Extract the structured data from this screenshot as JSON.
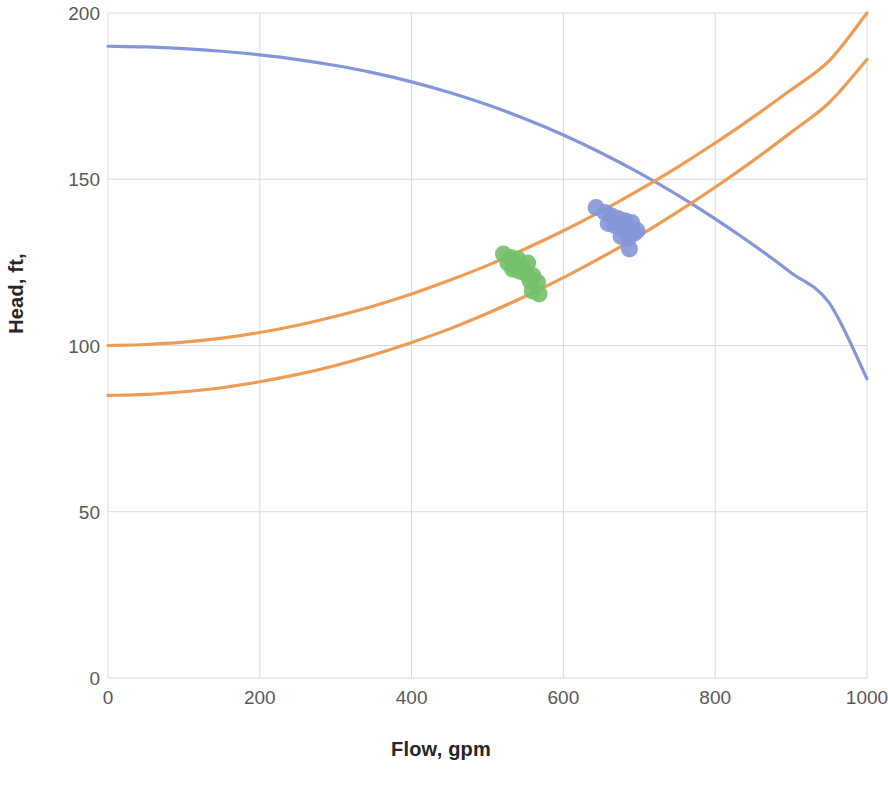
{
  "chart_data": {
    "type": "line",
    "title": "",
    "xlabel": "Flow, gpm",
    "ylabel": "Head, ft,",
    "xlim": [
      0,
      1000
    ],
    "ylim": [
      0,
      200
    ],
    "xticks": [
      0,
      200,
      400,
      600,
      800,
      1000
    ],
    "yticks": [
      0,
      50,
      100,
      150,
      200
    ],
    "xtick_labels": [
      "0",
      "200",
      "400",
      "600",
      "800",
      "1000"
    ],
    "ytick_labels": [
      "0",
      "50",
      "100",
      "150",
      "200"
    ],
    "grid": true,
    "grid_color": "#D9D9D9",
    "legend": "none",
    "series": [
      {
        "name": "Pump curve",
        "type": "line",
        "color": "#8496D9",
        "linewidth": 3.2,
        "x": [
          0,
          50,
          100,
          150,
          200,
          250,
          300,
          350,
          400,
          450,
          500,
          550,
          600,
          650,
          700,
          750,
          800,
          850,
          900,
          950,
          1000
        ],
        "y": [
          190.0,
          189.8,
          189.3,
          188.5,
          187.4,
          186.0,
          184.2,
          182.0,
          179.3,
          176.1,
          172.4,
          168.1,
          163.3,
          157.9,
          151.9,
          145.3,
          138.1,
          130.3,
          121.9,
          112.9,
          90.0
        ]
      },
      {
        "name": "System curve upper",
        "type": "line",
        "color": "#ED9C55",
        "linewidth": 3.2,
        "x": [
          0,
          50,
          100,
          150,
          200,
          250,
          300,
          350,
          400,
          450,
          500,
          550,
          600,
          650,
          700,
          750,
          800,
          850,
          900,
          950,
          1000
        ],
        "y": [
          100.0,
          100.3,
          101.0,
          102.2,
          103.9,
          106.1,
          108.8,
          111.9,
          115.5,
          119.6,
          124.1,
          129.1,
          134.5,
          140.4,
          146.8,
          153.6,
          160.9,
          168.7,
          176.9,
          185.6,
          200.0
        ]
      },
      {
        "name": "System curve lower",
        "type": "line",
        "color": "#ED9C55",
        "linewidth": 3.2,
        "x": [
          0,
          50,
          100,
          150,
          200,
          250,
          300,
          350,
          400,
          450,
          500,
          550,
          600,
          650,
          700,
          750,
          800,
          850,
          900,
          950,
          1000
        ],
        "y": [
          85.0,
          85.3,
          86.1,
          87.3,
          89.1,
          91.3,
          94.0,
          97.2,
          100.9,
          105.0,
          109.7,
          114.8,
          120.4,
          126.5,
          133.0,
          140.1,
          147.6,
          155.6,
          164.1,
          173.0,
          186.0
        ]
      },
      {
        "name": "Operating points - blue",
        "type": "scatter",
        "color": "#8496D9",
        "marker_size": 17,
        "points": [
          {
            "x": 643,
            "y": 141.5
          },
          {
            "x": 655,
            "y": 140.0
          },
          {
            "x": 663,
            "y": 139.0
          },
          {
            "x": 672,
            "y": 138.2
          },
          {
            "x": 681,
            "y": 137.5
          },
          {
            "x": 690,
            "y": 137.0
          },
          {
            "x": 659,
            "y": 136.7
          },
          {
            "x": 668,
            "y": 136.0
          },
          {
            "x": 677,
            "y": 135.3
          },
          {
            "x": 686,
            "y": 135.0
          },
          {
            "x": 697,
            "y": 134.6
          },
          {
            "x": 676,
            "y": 132.8
          },
          {
            "x": 686,
            "y": 132.3
          },
          {
            "x": 694,
            "y": 133.8
          },
          {
            "x": 687,
            "y": 129.0
          }
        ]
      },
      {
        "name": "Operating points - green",
        "type": "scatter",
        "color": "#76C06A",
        "marker_size": 17,
        "points": [
          {
            "x": 521,
            "y": 127.5
          },
          {
            "x": 531,
            "y": 126.5
          },
          {
            "x": 540,
            "y": 126.0
          },
          {
            "x": 527,
            "y": 124.8
          },
          {
            "x": 536,
            "y": 124.0
          },
          {
            "x": 545,
            "y": 124.3
          },
          {
            "x": 553,
            "y": 124.8
          },
          {
            "x": 533,
            "y": 123.0
          },
          {
            "x": 542,
            "y": 122.3
          },
          {
            "x": 551,
            "y": 121.6
          },
          {
            "x": 560,
            "y": 121.0
          },
          {
            "x": 556,
            "y": 119.4
          },
          {
            "x": 566,
            "y": 119.0
          },
          {
            "x": 559,
            "y": 116.4
          },
          {
            "x": 568,
            "y": 115.5
          }
        ]
      }
    ]
  }
}
